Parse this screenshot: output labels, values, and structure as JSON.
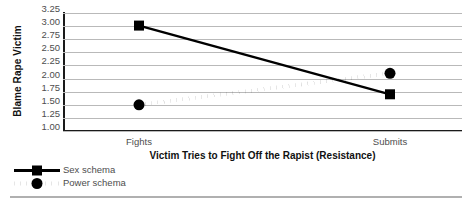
{
  "chart_data": {
    "type": "line",
    "title": "",
    "xlabel": "Victim Tries to Fight Off the Rapist (Resistance)",
    "ylabel": "Blame Rape Victim",
    "categories": [
      "Fights",
      "Submits"
    ],
    "ylim": [
      1.0,
      3.25
    ],
    "ytick_labels": [
      "3.25",
      "3.00",
      "2.75",
      "2.50",
      "2.25",
      "2.00",
      "1.75",
      "1.50",
      "1.25",
      "1.00"
    ],
    "ytick_values": [
      3.25,
      3.0,
      2.75,
      2.5,
      2.25,
      2.0,
      1.75,
      1.5,
      1.25,
      1.0
    ],
    "grid": true,
    "legend_position": "bottom-left",
    "series": [
      {
        "name": "Sex schema",
        "values": [
          3.01,
          1.7
        ],
        "line_style": "solid",
        "marker": "square",
        "color": "#000000"
      },
      {
        "name": "Power schema",
        "values": [
          1.5,
          2.1
        ],
        "line_style": "dotted",
        "marker": "diamond",
        "color": "#000000"
      }
    ]
  },
  "axis": {
    "y_title": "Blame Rape Victim",
    "x_title": "Victim Tries to Fight Off the Rapist (Resistance)",
    "x_categories": [
      "Fights",
      "Submits"
    ],
    "y_ticks": [
      "3.25",
      "3.00",
      "2.75",
      "2.50",
      "2.25",
      "2.00",
      "1.75",
      "1.50",
      "1.25",
      "1.00"
    ]
  },
  "legend": {
    "items": [
      {
        "label": "Sex schema"
      },
      {
        "label": "Power schema"
      }
    ]
  },
  "colors": {
    "series": "#000000",
    "gridline": "#b9b9b9",
    "axis": "#1a1a1a",
    "tick_text": "#4d4d4d",
    "title_text": "#111111",
    "rule": "#b0b0b0"
  }
}
